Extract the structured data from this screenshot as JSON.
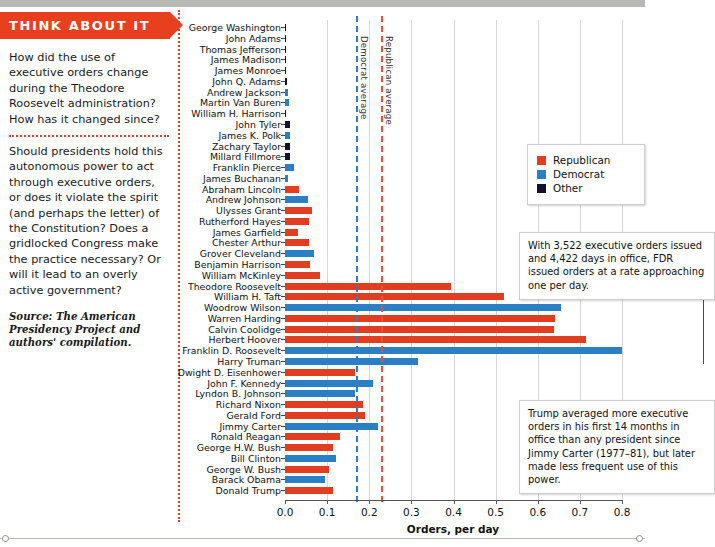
{
  "sidebar": {
    "banner_title": "THINK ABOUT IT",
    "paragraph_1": "How did the use of executive orders change during the Theodore Roosevelt administration? How has it changed since?",
    "paragraph_2": "Should presidents hold this autonomous power to act through executive orders, or does it violate the spirit (and perhaps the letter) of the Constitution? Does a gridlocked Congress make the practice necessary? Or will it lead to an overly active government?",
    "source": "Source: The American Presidency Project and authors' compilation."
  },
  "legend": {
    "items": [
      {
        "label": "Republican",
        "color": "#e23d21",
        "key": "rep"
      },
      {
        "label": "Democrat",
        "color": "#2b7fc4",
        "key": "dem"
      },
      {
        "label": "Other",
        "color": "#160f2e",
        "key": "other"
      }
    ]
  },
  "callouts": {
    "fdr": "With 3,522 executive orders issued and 4,422 days in office, FDR issued orders at a rate approaching one per day.",
    "trump": "Trump averaged more executive orders in his first 14 months in office than any president since Jimmy Carter (1977–81), but later made less frequent use of this power."
  },
  "reference_lines": [
    {
      "name": "Democrat average",
      "value": 0.168,
      "color": "#2b7fc4"
    },
    {
      "name": "Republican average",
      "value": 0.228,
      "color": "#e8503a"
    }
  ],
  "chart_data": {
    "type": "bar",
    "orientation": "horizontal",
    "title": "",
    "xlabel": "Orders, per day",
    "ylabel": "",
    "xlim": [
      0.0,
      0.8
    ],
    "xticks": [
      0.0,
      0.1,
      0.2,
      0.3,
      0.4,
      0.5,
      0.6,
      0.7,
      0.8
    ],
    "xtick_labels": [
      "0.0",
      "0.1",
      "0.2",
      "0.3",
      "0.4",
      "0.5",
      "0.6",
      "0.7",
      "0.8"
    ],
    "grid": true,
    "legend_position": "center-right",
    "categories": [
      "George Washington",
      "John Adams",
      "Thomas Jefferson",
      "James Madison",
      "James Monroe",
      "John Q. Adams",
      "Andrew Jackson",
      "Martin Van Buren",
      "William H. Harrison",
      "John Tyler",
      "James K. Polk",
      "Zachary Taylor",
      "Millard Fillmore",
      "Franklin Pierce",
      "James Buchanan",
      "Abraham Lincoln",
      "Andrew Johnson",
      "Ulysses Grant",
      "Rutherford Hayes",
      "James Garfield",
      "Chester Arthur",
      "Grover Cleveland",
      "Benjamin Harrison",
      "William McKinley",
      "Theodore Roosevelt",
      "William H. Taft",
      "Woodrow Wilson",
      "Warren Harding",
      "Calvin Coolidge",
      "Herbert Hoover",
      "Franklin D. Roosevelt",
      "Harry Truman",
      "Dwight D. Eisenhower",
      "John F. Kennedy",
      "Lyndon B. Johnson",
      "Richard Nixon",
      "Gerald Ford",
      "Jimmy Carter",
      "Ronald Reagan",
      "George H.W. Bush",
      "Bill Clinton",
      "George W. Bush",
      "Barack Obama",
      "Donald Trump"
    ],
    "values": [
      0.002,
      0.001,
      0.001,
      0.001,
      0.001,
      0.004,
      0.006,
      0.009,
      0.001,
      0.012,
      0.012,
      0.011,
      0.011,
      0.022,
      0.008,
      0.033,
      0.055,
      0.063,
      0.058,
      0.03,
      0.058,
      0.07,
      0.06,
      0.083,
      0.395,
      0.52,
      0.655,
      0.64,
      0.638,
      0.715,
      0.8,
      0.315,
      0.165,
      0.21,
      0.165,
      0.185,
      0.19,
      0.22,
      0.13,
      0.115,
      0.12,
      0.105,
      0.095,
      0.115
    ],
    "parties": [
      "other",
      "other",
      "other",
      "other",
      "other",
      "other",
      "dem",
      "dem",
      "other",
      "other",
      "dem",
      "other",
      "other",
      "dem",
      "dem",
      "rep",
      "dem",
      "rep",
      "rep",
      "rep",
      "rep",
      "dem",
      "rep",
      "rep",
      "rep",
      "rep",
      "dem",
      "rep",
      "rep",
      "rep",
      "dem",
      "dem",
      "rep",
      "dem",
      "dem",
      "rep",
      "rep",
      "dem",
      "rep",
      "rep",
      "dem",
      "rep",
      "dem",
      "rep"
    ]
  }
}
